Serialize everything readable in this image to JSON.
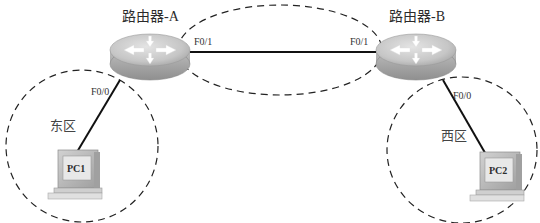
{
  "diagram": {
    "title": "",
    "colors": {
      "background": "#ffffff",
      "link": "#111111",
      "dashed_boundary": "#222222",
      "router_top": "#c9c9c9",
      "router_side": "#a9a9a9",
      "pc_body": "#bdbdbd",
      "pc_screen": "#e6e6e6"
    },
    "routers": [
      {
        "id": "router-a",
        "label": "路由器-A",
        "ports": [
          "F0/1",
          "F0/0"
        ]
      },
      {
        "id": "router-b",
        "label": "路由器-B",
        "ports": [
          "F0/1",
          "F0/0"
        ]
      }
    ],
    "hosts": [
      {
        "id": "pc1",
        "label": "PC1",
        "zone": "东区"
      },
      {
        "id": "pc2",
        "label": "PC2",
        "zone": "西区"
      }
    ],
    "zones": [
      {
        "id": "east",
        "label": "东区"
      },
      {
        "id": "west",
        "label": "西区"
      }
    ],
    "links": [
      {
        "from": "路由器-A",
        "from_port": "F0/1",
        "to": "路由器-B",
        "to_port": "F0/1"
      },
      {
        "from": "路由器-A",
        "from_port": "F0/0",
        "to": "PC1"
      },
      {
        "from": "路由器-B",
        "from_port": "F0/0",
        "to": "PC2"
      }
    ],
    "port_labels": {
      "a_f01": "F0/1",
      "a_f00": "F0/0",
      "b_f01": "F0/1",
      "b_f00": "F0/0"
    }
  }
}
